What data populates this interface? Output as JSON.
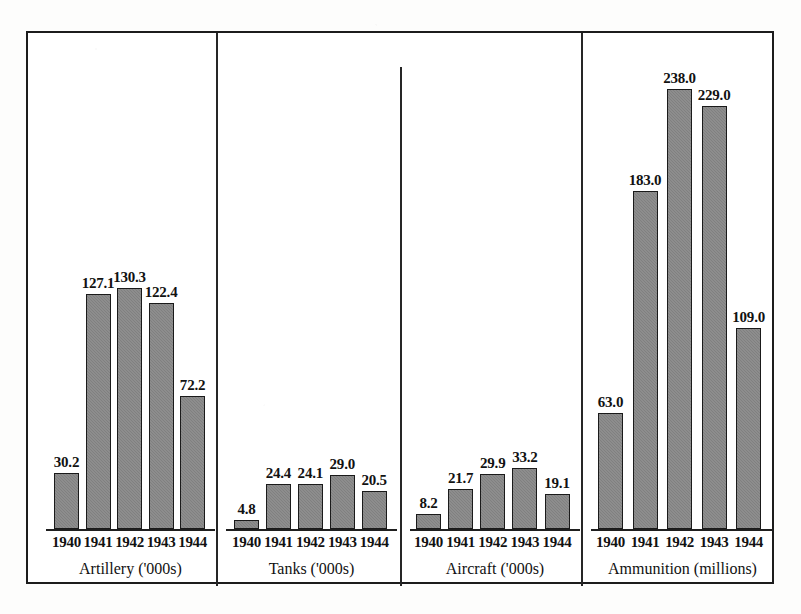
{
  "chart_data": {
    "type": "bar",
    "title": "",
    "subtitle": "",
    "xlabel": "",
    "ylabel": "",
    "grid": false,
    "legend": "none",
    "axis_note": "Four independent panels, each with its own baseline; y axis is unlabelled and values are printed above each bar.",
    "categories": [
      "1940",
      "1941",
      "1942",
      "1943",
      "1944"
    ],
    "panels": [
      {
        "label": "Artillery ('000s)",
        "unit": "'000s",
        "categories": [
          "1940",
          "1941",
          "1942",
          "1943",
          "1944"
        ],
        "values": [
          30.2,
          127.1,
          130.3,
          122.4,
          72.2
        ],
        "value_labels": [
          "30.2",
          "127.1",
          "130.3",
          "122.4",
          "72.2"
        ],
        "ylim": [
          0,
          250
        ]
      },
      {
        "label": "Tanks ('000s)",
        "unit": "'000s",
        "categories": [
          "1940",
          "1941",
          "1942",
          "1943",
          "1944"
        ],
        "values": [
          4.8,
          24.4,
          24.1,
          29.0,
          20.5
        ],
        "value_labels": [
          "4.8",
          "24.4",
          "24.1",
          "29.0",
          "20.5"
        ],
        "ylim": [
          0,
          250
        ]
      },
      {
        "label": "Aircraft ('000s)",
        "unit": "'000s",
        "categories": [
          "1940",
          "1941",
          "1942",
          "1943",
          "1944"
        ],
        "values": [
          8.2,
          21.7,
          29.9,
          33.2,
          19.1
        ],
        "value_labels": [
          "8.2",
          "21.7",
          "29.9",
          "33.2",
          "19.1"
        ],
        "ylim": [
          0,
          250
        ]
      },
      {
        "label": "Ammunition (millions)",
        "unit": "millions",
        "categories": [
          "1940",
          "1941",
          "1942",
          "1943",
          "1944"
        ],
        "values": [
          63.0,
          183.0,
          238.0,
          229.0,
          109.0
        ],
        "value_labels": [
          "63.0",
          "183.0",
          "238.0",
          "229.0",
          "109.0"
        ],
        "ylim": [
          0,
          250
        ]
      }
    ],
    "colors": {
      "bar_fill": "#808080",
      "bar_outline": "#1a1a1a",
      "frame": "#1c1c1c",
      "text": "#121212",
      "background": "#ffffff"
    }
  },
  "layout": {
    "frame": {
      "left": 26,
      "top": 31,
      "width": 748,
      "height": 553
    },
    "baseline_y": 527,
    "px_per_unit": 1.848,
    "bar_width": 25,
    "dividers": [
      {
        "x": 214,
        "top": 31,
        "height": 553
      },
      {
        "x": 398,
        "top": 65,
        "height": 519
      },
      {
        "x": 579,
        "top": 31,
        "height": 553
      }
    ],
    "panel_bounds": [
      {
        "axis_left": 44,
        "axis_right": 213,
        "first_bar_left": 52
      },
      {
        "axis_left": 224,
        "axis_right": 395,
        "first_bar_left": 232
      },
      {
        "axis_left": 408,
        "axis_right": 578,
        "first_bar_left": 414
      },
      {
        "axis_left": 589,
        "axis_right": 772,
        "first_bar_left": 596
      }
    ],
    "year_label_y": 532,
    "caption_y": 558
  }
}
